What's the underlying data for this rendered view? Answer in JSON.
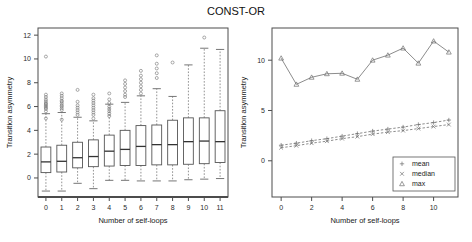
{
  "figure": {
    "title": "CONST-OR",
    "width": 472,
    "height": 242
  },
  "chart_data": [
    {
      "type": "box",
      "panel": "left",
      "title": "",
      "xlabel": "Number of self-loops",
      "ylabel": "Transition asymmetry",
      "categories": [
        "0",
        "1",
        "2",
        "3",
        "4",
        "5",
        "6",
        "7",
        "8",
        "9",
        "10",
        "11"
      ],
      "xticklabels": [
        "0",
        "1",
        "2",
        "3",
        "4",
        "5",
        "6",
        "7",
        "8",
        "9",
        "10",
        "11"
      ],
      "yticks": [
        0,
        2,
        4,
        6,
        8,
        10,
        12
      ],
      "yticklabels": [
        "0",
        "2",
        "4",
        "6",
        "8",
        "10",
        "12"
      ],
      "ylim": [
        -1.6,
        12.6
      ],
      "grid": false,
      "boxes": [
        {
          "category": "0",
          "whisker_low": -1.1,
          "q1": 0.45,
          "median": 1.35,
          "q3": 2.6,
          "whisker_high": 5.4,
          "outliers": [
            5.6,
            5.8,
            5.9,
            6.0,
            6.1,
            6.2,
            6.3,
            6.45,
            6.6,
            6.8,
            7.0,
            5.0,
            10.2
          ]
        },
        {
          "category": "1",
          "whisker_low": -1.1,
          "q1": 0.5,
          "median": 1.4,
          "q3": 2.75,
          "whisker_high": 5.5,
          "outliers": [
            5.7,
            5.85,
            6.0,
            6.1,
            6.25,
            6.4,
            6.5,
            6.7,
            6.9,
            7.1,
            4.9
          ]
        },
        {
          "category": "2",
          "whisker_low": -0.45,
          "q1": 0.85,
          "median": 1.7,
          "q3": 3.0,
          "whisker_high": 5.1,
          "outliers": [
            5.3,
            5.5,
            5.7,
            5.9,
            6.1,
            6.4,
            7.4
          ]
        },
        {
          "category": "3",
          "whisker_low": -0.9,
          "q1": 0.95,
          "median": 1.8,
          "q3": 3.2,
          "whisker_high": 4.8,
          "outliers": [
            5.0,
            5.3,
            5.5,
            5.7,
            5.9,
            6.1,
            6.3,
            6.5,
            6.7,
            7.0
          ]
        },
        {
          "category": "4",
          "whisker_low": -0.2,
          "q1": 1.0,
          "median": 2.25,
          "q3": 3.6,
          "whisker_high": 6.2,
          "outliers": [
            5.2,
            5.4,
            5.6,
            5.8,
            6.0,
            6.3,
            6.6,
            7.1
          ]
        },
        {
          "category": "5",
          "whisker_low": -0.2,
          "q1": 1.05,
          "median": 2.4,
          "q3": 4.0,
          "whisker_high": 6.35,
          "outliers": [
            6.8,
            7.0,
            7.3,
            7.6,
            7.9,
            8.2
          ]
        },
        {
          "category": "6",
          "whisker_low": -0.25,
          "q1": 1.05,
          "median": 2.65,
          "q3": 4.4,
          "whisker_high": 6.9,
          "outliers": [
            7.1,
            7.4,
            7.7,
            8.0,
            8.3,
            8.6,
            9.0
          ]
        },
        {
          "category": "7",
          "whisker_low": -0.25,
          "q1": 1.1,
          "median": 2.8,
          "q3": 4.45,
          "whisker_high": 7.5,
          "outliers": [
            8.4,
            8.8,
            9.2,
            9.6,
            10.3
          ]
        },
        {
          "category": "8",
          "whisker_low": -0.25,
          "q1": 1.1,
          "median": 2.8,
          "q3": 4.85,
          "whisker_high": 6.85,
          "outliers": [
            9.7
          ]
        },
        {
          "category": "9",
          "whisker_low": -0.15,
          "q1": 1.15,
          "median": 3.05,
          "q3": 5.05,
          "whisker_high": 9.5,
          "outliers": []
        },
        {
          "category": "10",
          "whisker_low": -0.1,
          "q1": 1.2,
          "median": 3.1,
          "q3": 5.05,
          "whisker_high": 10.9,
          "outliers": [
            11.8
          ]
        },
        {
          "category": "11",
          "whisker_low": -0.05,
          "q1": 1.3,
          "median": 3.05,
          "q3": 5.65,
          "whisker_high": 10.8,
          "outliers": []
        }
      ]
    },
    {
      "type": "line",
      "panel": "right",
      "title": "",
      "xlabel": "Number of self-loops",
      "ylabel": "Transition asymmetry",
      "x": [
        0,
        1,
        2,
        3,
        4,
        5,
        6,
        7,
        8,
        9,
        10,
        11
      ],
      "xticks": [
        0,
        2,
        4,
        6,
        8,
        10
      ],
      "xticklabels": [
        "0",
        "2",
        "4",
        "6",
        "8",
        "10"
      ],
      "yticks": [
        0,
        5,
        10
      ],
      "yticklabels": [
        "0",
        "5",
        "10"
      ],
      "xlim": [
        -0.6,
        11.6
      ],
      "ylim": [
        -3.6,
        13.2
      ],
      "grid": false,
      "legend_position": "bottom-right",
      "series": [
        {
          "name": "mean",
          "symbol": "plus",
          "linestyle": "dashed",
          "values": [
            1.55,
            1.75,
            2.0,
            2.2,
            2.45,
            2.7,
            2.95,
            3.15,
            3.35,
            3.6,
            3.8,
            4.05
          ]
        },
        {
          "name": "median",
          "symbol": "cross",
          "linestyle": "dashed",
          "values": [
            1.3,
            1.5,
            1.75,
            1.95,
            2.2,
            2.4,
            2.65,
            2.85,
            3.0,
            3.2,
            3.4,
            3.6
          ]
        },
        {
          "name": "max",
          "symbol": "triangle",
          "linestyle": "solid",
          "values": [
            10.2,
            7.6,
            8.3,
            8.65,
            8.7,
            8.1,
            10.0,
            10.5,
            11.2,
            9.7,
            11.9,
            10.8
          ]
        }
      ]
    }
  ],
  "legend": {
    "items": [
      {
        "label": "mean",
        "symbol": "plus"
      },
      {
        "label": "median",
        "symbol": "cross"
      },
      {
        "label": "max",
        "symbol": "triangle"
      }
    ]
  }
}
